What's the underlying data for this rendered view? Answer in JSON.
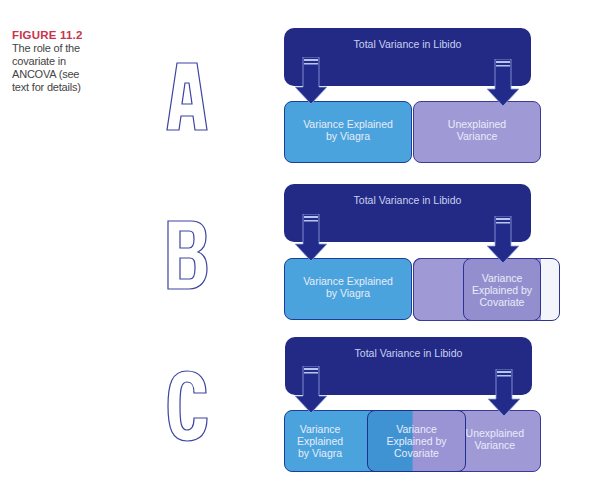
{
  "caption": {
    "figure_label": "FIGURE 11.2",
    "text_lines": [
      "The role of the",
      "covariate in",
      "ANCOVA (see",
      "text for details)"
    ]
  },
  "colors": {
    "figure_label": "#c8334d",
    "total_box": "#222a86",
    "viagra_box": "#4aa3dd",
    "unexplained_box": "#9f9ad6",
    "letter_outline": "#3b44a0"
  },
  "panels": [
    {
      "letter": "A",
      "total": "Total Variance in Libido",
      "viagra": [
        "Variance Explained",
        "by Viagra"
      ],
      "unexplained": [
        "Unexplained",
        "Variance"
      ]
    },
    {
      "letter": "B",
      "total": "Total Variance in Libido",
      "viagra": [
        "Variance Explained",
        "by Viagra"
      ],
      "covariate": [
        "Variance",
        "Explained by",
        "Covariate"
      ]
    },
    {
      "letter": "C",
      "total": "Total Variance in Libido",
      "viagra": [
        "Variance",
        "Explained",
        "by Viagra"
      ],
      "covariate": [
        "Variance",
        "Explained by",
        "Covariate"
      ],
      "unexplained": [
        "Unexplained",
        "Variance"
      ]
    }
  ]
}
